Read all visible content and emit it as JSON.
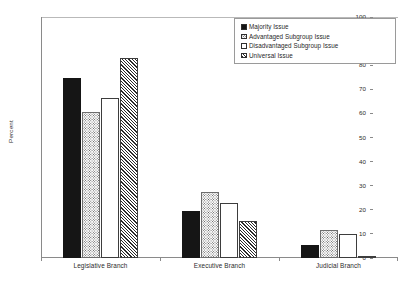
{
  "chart_data": {
    "type": "bar",
    "title": "",
    "xlabel": "",
    "ylabel": "Percent",
    "ylim": [
      0,
      100
    ],
    "ytick_step": 10,
    "yticks": [
      0,
      10,
      20,
      30,
      40,
      50,
      60,
      70,
      80,
      90,
      100
    ],
    "grid": false,
    "legend_position": "top-right",
    "categories": [
      "Legislative Branch",
      "Executive Branch",
      "Judicial Branch"
    ],
    "series": [
      {
        "name": "Majority Issue",
        "fill": "solid",
        "values": [
          74.5,
          19.5,
          5.5
        ]
      },
      {
        "name": "Advantaged Subgroup Issue",
        "fill": "dotted",
        "values": [
          60.5,
          27.5,
          11.5
        ]
      },
      {
        "name": "Disadvantaged Subgroup Issue",
        "fill": "empty",
        "values": [
          66.5,
          23.0,
          10.0
        ]
      },
      {
        "name": "Universal Issue",
        "fill": "hatch",
        "values": [
          83.0,
          15.5,
          1.0
        ]
      }
    ]
  },
  "axis": {
    "y_title": "Percent"
  },
  "colors": {
    "solid": "#151515",
    "axis": "#8a8a8a",
    "text": "#2b2b2b",
    "legend_border": "#9a9a9a"
  }
}
